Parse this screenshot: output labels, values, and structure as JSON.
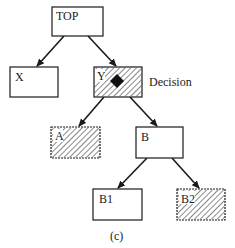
{
  "diagram": {
    "type": "tree",
    "caption": "(c)",
    "colors": {
      "stroke": "#1a1a1a",
      "hatch": "#3a3a3a",
      "background": "#ffffff"
    },
    "nodes": [
      {
        "id": "top",
        "label": "TOP",
        "hatched": false
      },
      {
        "id": "x",
        "label": "X",
        "hatched": false
      },
      {
        "id": "y",
        "label": "Y",
        "hatched": true,
        "marker": "diamond",
        "annotation": "Decision"
      },
      {
        "id": "a",
        "label": "A",
        "hatched": true
      },
      {
        "id": "b",
        "label": "B",
        "hatched": false
      },
      {
        "id": "b1",
        "label": "B1",
        "hatched": false
      },
      {
        "id": "b2",
        "label": "B2",
        "hatched": true
      }
    ],
    "edges": [
      {
        "from": "TOP",
        "to": "X"
      },
      {
        "from": "TOP",
        "to": "Y"
      },
      {
        "from": "Y",
        "to": "A"
      },
      {
        "from": "Y",
        "to": "B"
      },
      {
        "from": "B",
        "to": "B1"
      },
      {
        "from": "B",
        "to": "B2"
      }
    ]
  }
}
